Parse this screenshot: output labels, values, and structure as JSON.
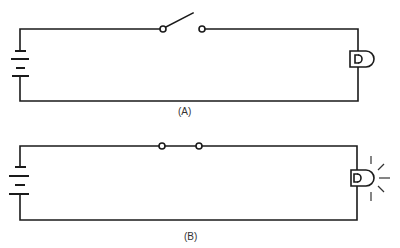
{
  "diagrams": [
    {
      "id": "A",
      "caption": "(A)",
      "switch_state": "open",
      "lamp_state": "off",
      "components": [
        "battery",
        "switch",
        "lamp"
      ]
    },
    {
      "id": "B",
      "caption": "(B)",
      "switch_state": "closed",
      "lamp_state": "lit",
      "components": [
        "battery",
        "switch",
        "lamp"
      ]
    }
  ],
  "colors": {
    "line": "#1a1a1a",
    "background": "#ffffff"
  }
}
